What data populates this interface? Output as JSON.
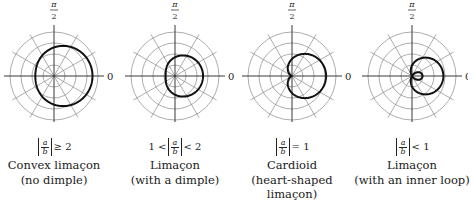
{
  "figure": {
    "axis_labels": {
      "top": "π/2",
      "top_num": "π",
      "top_den": "2",
      "right": "0"
    },
    "grid": {
      "rings": 4,
      "ring_spacing_px": 11,
      "spoke_step_deg": 30,
      "grid_color": "#8a8a8a",
      "curve_color": "#111111"
    },
    "panels": [
      {
        "id": "convex",
        "center": [
          54,
          76
        ],
        "a": 2.6,
        "b": 0.9,
        "condition": {
          "prefix": "",
          "num": "a",
          "den": "b",
          "op": "≥ 2"
        },
        "name": "Convex limaçon",
        "subtitle": "(no dimple)"
      },
      {
        "id": "dimple",
        "center": [
          175,
          76
        ],
        "a": 1.7,
        "b": 0.85,
        "condition": {
          "prefix": "1 <",
          "num": "a",
          "den": "b",
          "op": "< 2"
        },
        "name": "Limaçon",
        "subtitle": "(with a dimple)"
      },
      {
        "id": "cardioid",
        "center": [
          292,
          76
        ],
        "a": 1.55,
        "b": 1.55,
        "condition": {
          "prefix": "",
          "num": "a",
          "den": "b",
          "op": "= 1"
        },
        "name": "Cardioid",
        "subtitle": "(heart-shaped limaçon)"
      },
      {
        "id": "inner-loop",
        "center": [
          412,
          76
        ],
        "a": 0.95,
        "b": 1.9,
        "condition": {
          "prefix": "",
          "num": "a",
          "den": "b",
          "op": "< 1"
        },
        "name": "Limaçon",
        "subtitle": "(with an inner loop)"
      }
    ]
  }
}
